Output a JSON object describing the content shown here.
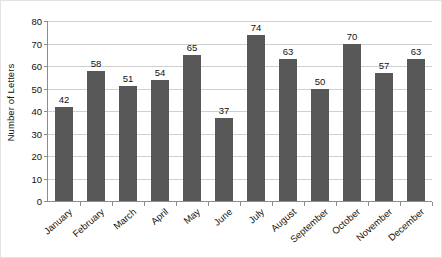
{
  "chart_data": {
    "type": "bar",
    "title": "",
    "subtitle": "",
    "xlabel": "",
    "ylabel": "Number of Letters",
    "categories": [
      "January",
      "February",
      "March",
      "April",
      "May",
      "June",
      "July",
      "August",
      "September",
      "October",
      "November",
      "December"
    ],
    "values": [
      42,
      58,
      51,
      54,
      65,
      37,
      74,
      63,
      50,
      70,
      57,
      63
    ],
    "ylim": [
      0,
      80
    ],
    "y_ticks": [
      0,
      10,
      20,
      30,
      40,
      50,
      60,
      70,
      80
    ],
    "y_tick_labels": [
      "0",
      "10",
      "20",
      "30",
      "40",
      "50",
      "60",
      "70",
      "80"
    ],
    "data_labels": [
      "42",
      "58",
      "51",
      "54",
      "65",
      "37",
      "74",
      "63",
      "50",
      "70",
      "57",
      "63"
    ],
    "grid": true,
    "grid_axis": "y",
    "legend": false,
    "legend_position": "none",
    "bar_color": "#575857",
    "gridline_color": "#cfcfcf",
    "axis_color": "#8c8c8c",
    "text_color": "#111111",
    "background_color": "#ffffff",
    "x_label_rotation": -41
  }
}
